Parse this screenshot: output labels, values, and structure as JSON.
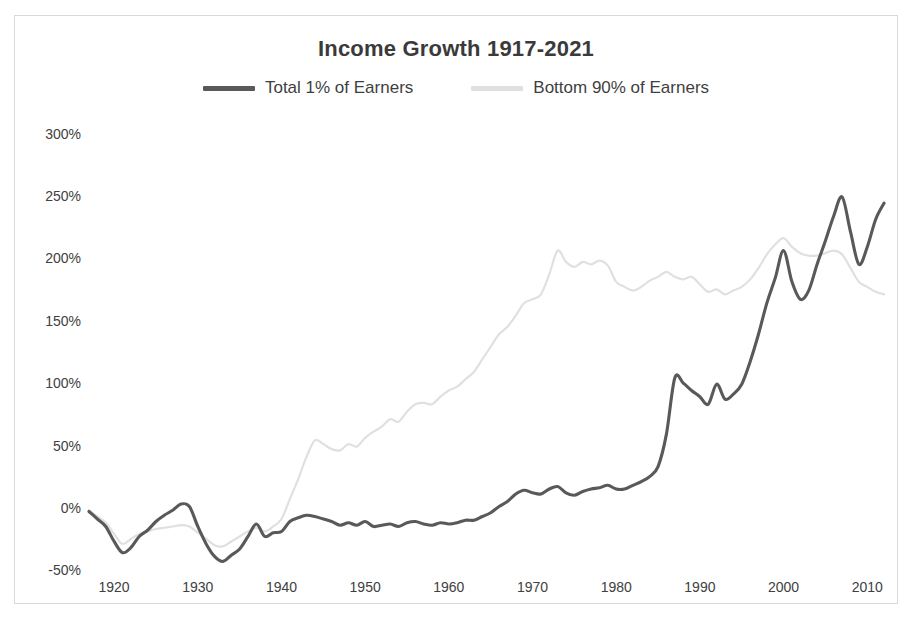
{
  "chart_data": {
    "type": "line",
    "title": "Income Growth 1917-2021",
    "xlabel": "",
    "ylabel": "",
    "xlim": [
      1917,
      2021
    ],
    "ylim": [
      -50,
      300
    ],
    "grid": false,
    "legend_position": "top-center",
    "y_tick_labels": [
      "300%",
      "250%",
      "200%",
      "150%",
      "100%",
      "50%",
      "0%",
      "-50%"
    ],
    "y_tick_values": [
      300,
      250,
      200,
      150,
      100,
      50,
      0,
      -50
    ],
    "x_tick_labels": [
      "1920",
      "1930",
      "1940",
      "1950",
      "1960",
      "1970",
      "1980",
      "1990",
      "2000",
      "2010"
    ],
    "x_tick_values": [
      1920,
      1930,
      1940,
      1950,
      1960,
      1970,
      1980,
      1990,
      2000,
      2010
    ],
    "series": [
      {
        "name": "Total 1% of Earners",
        "color": "#595959",
        "x": [
          1917,
          1918,
          1919,
          1920,
          1921,
          1922,
          1923,
          1924,
          1925,
          1926,
          1927,
          1928,
          1929,
          1930,
          1931,
          1932,
          1933,
          1934,
          1935,
          1936,
          1937,
          1938,
          1939,
          1940,
          1941,
          1942,
          1943,
          1944,
          1945,
          1946,
          1947,
          1948,
          1949,
          1950,
          1951,
          1952,
          1953,
          1954,
          1955,
          1956,
          1957,
          1958,
          1959,
          1960,
          1961,
          1962,
          1963,
          1964,
          1965,
          1966,
          1967,
          1968,
          1969,
          1970,
          1971,
          1972,
          1973,
          1974,
          1975,
          1976,
          1977,
          1978,
          1979,
          1980,
          1981,
          1982,
          1983,
          1984,
          1985,
          1986,
          1987,
          1988,
          1989,
          1990,
          1991,
          1992,
          1993,
          1994,
          1995,
          1996,
          1997,
          1998,
          1999,
          2000,
          2001,
          2002,
          2003,
          2004,
          2005,
          2006,
          2007,
          2008,
          2009,
          2010,
          2011,
          2012
        ],
        "y": [
          -2,
          -8,
          -14,
          -26,
          -35,
          -31,
          -22,
          -17,
          -10,
          -5,
          -1,
          4,
          2,
          -14,
          -28,
          -38,
          -42,
          -37,
          -32,
          -22,
          -12,
          -22,
          -19,
          -18,
          -10,
          -7,
          -5,
          -6,
          -8,
          -10,
          -13,
          -11,
          -13,
          -10,
          -14,
          -13,
          -12,
          -14,
          -11,
          -10,
          -12,
          -13,
          -11,
          -12,
          -11,
          -9,
          -9,
          -6,
          -3,
          2,
          6,
          12,
          15,
          13,
          12,
          16,
          18,
          13,
          11,
          14,
          16,
          17,
          19,
          16,
          16,
          19,
          22,
          26,
          34,
          60,
          105,
          101,
          95,
          90,
          84,
          100,
          88,
          92,
          100,
          118,
          140,
          165,
          185,
          207,
          182,
          168,
          175,
          196,
          215,
          235,
          250,
          222,
          196,
          210,
          232,
          245
        ]
      },
      {
        "name": "Bottom 90% of Earners",
        "color": "#e0e0e0",
        "x": [
          1917,
          1918,
          1919,
          1920,
          1921,
          1922,
          1923,
          1924,
          1925,
          1926,
          1927,
          1928,
          1929,
          1930,
          1931,
          1932,
          1933,
          1934,
          1935,
          1936,
          1937,
          1938,
          1939,
          1940,
          1941,
          1942,
          1943,
          1944,
          1945,
          1946,
          1947,
          1948,
          1949,
          1950,
          1951,
          1952,
          1953,
          1954,
          1955,
          1956,
          1957,
          1958,
          1959,
          1960,
          1961,
          1962,
          1963,
          1964,
          1965,
          1966,
          1967,
          1968,
          1969,
          1970,
          1971,
          1972,
          1973,
          1974,
          1975,
          1976,
          1977,
          1978,
          1979,
          1980,
          1981,
          1982,
          1983,
          1984,
          1985,
          1986,
          1987,
          1988,
          1989,
          1990,
          1991,
          1992,
          1993,
          1994,
          1995,
          1996,
          1997,
          1998,
          1999,
          2000,
          2001,
          2002,
          2003,
          2004,
          2005,
          2006,
          2007,
          2008,
          2009,
          2010,
          2011,
          2012
        ],
        "y": [
          -1,
          -6,
          -11,
          -20,
          -28,
          -24,
          -20,
          -18,
          -16,
          -15,
          -14,
          -13,
          -14,
          -19,
          -24,
          -29,
          -30,
          -26,
          -22,
          -18,
          -15,
          -18,
          -14,
          -8,
          8,
          24,
          42,
          55,
          52,
          48,
          47,
          52,
          50,
          57,
          62,
          66,
          72,
          70,
          78,
          84,
          85,
          84,
          90,
          95,
          98,
          104,
          110,
          120,
          130,
          140,
          146,
          155,
          165,
          168,
          172,
          188,
          207,
          198,
          194,
          198,
          196,
          199,
          195,
          182,
          178,
          175,
          178,
          183,
          186,
          190,
          186,
          184,
          186,
          180,
          174,
          176,
          172,
          175,
          178,
          184,
          193,
          204,
          212,
          217,
          210,
          205,
          203,
          203,
          205,
          207,
          204,
          193,
          182,
          178,
          174,
          172
        ]
      }
    ]
  },
  "legend": {
    "items": [
      {
        "label": "Total 1% of Earners",
        "color": "#595959"
      },
      {
        "label": "Bottom 90% of Earners",
        "color": "#e0e0e0"
      }
    ]
  }
}
